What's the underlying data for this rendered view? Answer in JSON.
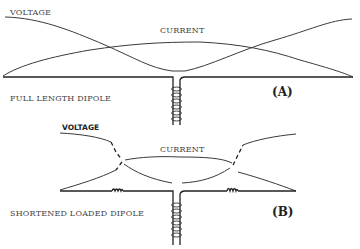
{
  "diagram_a": {
    "voltage_label": "VOLTAGE",
    "current_label": "CURRENT",
    "caption": "FULL LENGTH DIPOLE",
    "tag": "(A)"
  },
  "diagram_b": {
    "voltage_label": "VOLTAGE",
    "current_label": "CURRENT",
    "caption": "SHORTENED LOADED DIPOLE",
    "tag": "(B)"
  },
  "colors": {
    "background": "#ffffff",
    "ink": "#222222"
  }
}
